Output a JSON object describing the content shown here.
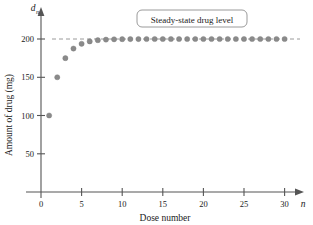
{
  "chart_data": {
    "type": "scatter",
    "title": "",
    "xlabel": "Dose number",
    "ylabel": "Amount of drug (mg)",
    "x_axis_variable": "n",
    "y_axis_variable": "d",
    "y_axis_variable_subscript": "n",
    "xlim": [
      0,
      32
    ],
    "ylim": [
      0,
      215
    ],
    "xticks": [
      0,
      5,
      10,
      15,
      20,
      25,
      30
    ],
    "xtick_labels": [
      "0",
      "5",
      "10",
      "15",
      "20",
      "25",
      "30"
    ],
    "yticks": [
      50,
      100,
      150,
      200
    ],
    "ytick_labels": [
      "50",
      "100",
      "150",
      "200"
    ],
    "grid": false,
    "legend": false,
    "annotations": [
      {
        "text": "Steady-state drug level",
        "kind": "boxed-callout",
        "x": 19,
        "y": 207
      }
    ],
    "reference_lines": [
      {
        "name": "steady-state",
        "orientation": "horizontal",
        "value": 200,
        "style": "dashed",
        "color": "#9a9a9a"
      }
    ],
    "series": [
      {
        "name": "Amount of drug after dose n",
        "marker": "circle",
        "color": "#8a8a8a",
        "x": [
          1,
          2,
          3,
          4,
          5,
          6,
          7,
          8,
          9,
          10,
          11,
          12,
          13,
          14,
          15,
          16,
          17,
          18,
          19,
          20,
          21,
          22,
          23,
          24,
          25,
          26,
          27,
          28,
          29,
          30
        ],
        "values": [
          100,
          150,
          175,
          187.5,
          193.75,
          196.88,
          198.44,
          199.22,
          199.61,
          199.8,
          199.9,
          199.95,
          199.98,
          199.99,
          199.99,
          200,
          200,
          200,
          200,
          200,
          200,
          200,
          200,
          200,
          200,
          200,
          200,
          200,
          200,
          200
        ]
      }
    ]
  },
  "geometry": {
    "origin_x": 41,
    "origin_y": 192,
    "px_per_x_unit": 8.12,
    "px_per_y_unit": 0.765,
    "x_axis_end": 303,
    "y_axis_top": 10,
    "dot_radius": 2.6,
    "callout": {
      "x": 137,
      "y": 10,
      "w": 110,
      "h": 17,
      "rx": 5
    }
  }
}
